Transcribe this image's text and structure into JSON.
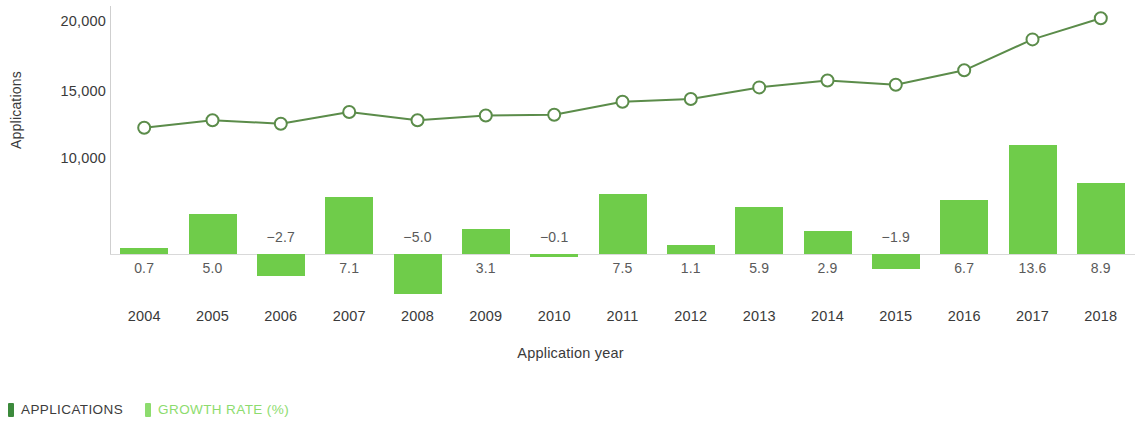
{
  "chart_data": {
    "type": "bar",
    "title": "",
    "subtitle": "",
    "xlabel": "Application year",
    "ylabel": "Applications",
    "categories": [
      "2004",
      "2005",
      "2006",
      "2007",
      "2008",
      "2009",
      "2010",
      "2011",
      "2012",
      "2013",
      "2014",
      "2015",
      "2016",
      "2017",
      "2018"
    ],
    "y_ticks": [
      "20,000",
      "15,000",
      "10,000"
    ],
    "y_tick_values": [
      20000,
      15000,
      10000
    ],
    "ylim": [
      0,
      21500
    ],
    "grid": false,
    "legend_position": "bottom-left",
    "series": [
      {
        "name": "APPLICATIONS",
        "type": "line",
        "marker": "open-circle",
        "color": "#5b8c4a",
        "values": [
          12350,
          12900,
          12650,
          13500,
          12900,
          13250,
          13300,
          14250,
          14450,
          15300,
          15800,
          15500,
          16550,
          18800,
          20350
        ]
      },
      {
        "name": "GROWTH RATE (%)",
        "type": "bar",
        "color": "#6fcc4a",
        "values": [
          0.7,
          5.0,
          -2.7,
          7.1,
          -5.0,
          3.1,
          -0.1,
          7.5,
          1.1,
          5.9,
          2.9,
          -1.9,
          6.7,
          13.6,
          8.9
        ],
        "value_labels": [
          "0.7",
          "5.0",
          "−2.7",
          "7.1",
          "−5.0",
          "3.1",
          "−0.1",
          "7.5",
          "1.1",
          "5.9",
          "2.9",
          "−1.9",
          "6.7",
          "13.6",
          "8.9"
        ]
      }
    ]
  },
  "legend": {
    "items": [
      {
        "label": "APPLICATIONS",
        "color": "#3c8a3c"
      },
      {
        "label": "GROWTH RATE (%)",
        "color": "#8ddc6e"
      }
    ]
  },
  "axes": {
    "y_title": "Applications",
    "x_title": "Application year"
  },
  "colors": {
    "bar": "#6fcc4a",
    "line": "#5b8c4a",
    "axis": "#cfcfcf",
    "text": "#3a3a3a",
    "label_text": "#5a5a5a"
  }
}
